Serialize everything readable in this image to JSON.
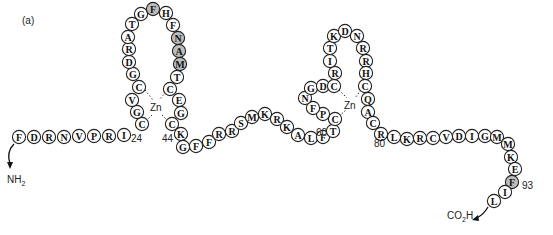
{
  "panel_label": "(a)",
  "colors": {
    "residue_fill": "#ffffff",
    "residue_highlight": "#bdbdbd",
    "stroke": "#222222"
  },
  "termini": {
    "n_term": "NH2",
    "c_term": "CO2H"
  },
  "zinc_labels": [
    "Zn",
    "Zn"
  ],
  "position_labels": [
    {
      "text": "24",
      "x": 131,
      "y": 142
    },
    {
      "text": "44",
      "x": 162,
      "y": 142
    },
    {
      "text": "60",
      "x": 316,
      "y": 136
    },
    {
      "text": "80",
      "x": 374,
      "y": 147
    },
    {
      "text": "93",
      "x": 522,
      "y": 189
    }
  ],
  "residues": [
    {
      "aa": "F",
      "x": 19,
      "y": 137
    },
    {
      "aa": "D",
      "x": 34,
      "y": 137
    },
    {
      "aa": "R",
      "x": 49,
      "y": 137
    },
    {
      "aa": "N",
      "x": 64,
      "y": 137
    },
    {
      "aa": "V",
      "x": 79,
      "y": 136
    },
    {
      "aa": "P",
      "x": 94,
      "y": 136
    },
    {
      "aa": "R",
      "x": 109,
      "y": 136
    },
    {
      "aa": "I",
      "x": 124,
      "y": 135
    },
    {
      "aa": "C",
      "x": 142,
      "y": 124
    },
    {
      "aa": "G",
      "x": 137,
      "y": 112
    },
    {
      "aa": "V",
      "x": 132,
      "y": 100
    },
    {
      "aa": "C",
      "x": 139,
      "y": 87
    },
    {
      "aa": "G",
      "x": 133,
      "y": 74
    },
    {
      "aa": "D",
      "x": 129,
      "y": 62
    },
    {
      "aa": "R",
      "x": 129,
      "y": 49
    },
    {
      "aa": "A",
      "x": 128,
      "y": 37
    },
    {
      "aa": "T",
      "x": 132,
      "y": 24
    },
    {
      "aa": "G",
      "x": 141,
      "y": 14
    },
    {
      "aa": "F",
      "x": 153,
      "y": 9,
      "hl": true
    },
    {
      "aa": "H",
      "x": 166,
      "y": 13
    },
    {
      "aa": "F",
      "x": 173,
      "y": 25
    },
    {
      "aa": "N",
      "x": 178,
      "y": 38,
      "hl": true
    },
    {
      "aa": "A",
      "x": 179,
      "y": 51,
      "hl": true
    },
    {
      "aa": "M",
      "x": 180,
      "y": 64,
      "hl": true
    },
    {
      "aa": "T",
      "x": 177,
      "y": 77
    },
    {
      "aa": "C",
      "x": 170,
      "y": 89
    },
    {
      "aa": "E",
      "x": 179,
      "y": 100
    },
    {
      "aa": "G",
      "x": 181,
      "y": 113
    },
    {
      "aa": "C",
      "x": 172,
      "y": 124
    },
    {
      "aa": "K",
      "x": 181,
      "y": 134
    },
    {
      "aa": "G",
      "x": 183,
      "y": 147
    },
    {
      "aa": "F",
      "x": 196,
      "y": 146
    },
    {
      "aa": "F",
      "x": 209,
      "y": 142
    },
    {
      "aa": "R",
      "x": 219,
      "y": 134
    },
    {
      "aa": "R",
      "x": 232,
      "y": 131
    },
    {
      "aa": "S",
      "x": 241,
      "y": 123
    },
    {
      "aa": "M",
      "x": 252,
      "y": 117
    },
    {
      "aa": "K",
      "x": 265,
      "y": 114
    },
    {
      "aa": "R",
      "x": 277,
      "y": 119
    },
    {
      "aa": "K",
      "x": 287,
      "y": 127
    },
    {
      "aa": "A",
      "x": 298,
      "y": 135
    },
    {
      "aa": "L",
      "x": 311,
      "y": 138
    },
    {
      "aa": "F",
      "x": 323,
      "y": 137
    },
    {
      "aa": "T",
      "x": 333,
      "y": 131
    },
    {
      "aa": "C",
      "x": 335,
      "y": 119
    },
    {
      "aa": "P",
      "x": 323,
      "y": 114
    },
    {
      "aa": "F",
      "x": 313,
      "y": 108
    },
    {
      "aa": "N",
      "x": 305,
      "y": 98
    },
    {
      "aa": "G",
      "x": 311,
      "y": 88
    },
    {
      "aa": "D",
      "x": 323,
      "y": 86
    },
    {
      "aa": "C",
      "x": 334,
      "y": 86
    },
    {
      "aa": "R",
      "x": 335,
      "y": 73
    },
    {
      "aa": "I",
      "x": 330,
      "y": 61
    },
    {
      "aa": "T",
      "x": 330,
      "y": 48
    },
    {
      "aa": "K",
      "x": 334,
      "y": 36
    },
    {
      "aa": "D",
      "x": 345,
      "y": 31
    },
    {
      "aa": "N",
      "x": 357,
      "y": 36
    },
    {
      "aa": "R",
      "x": 363,
      "y": 48
    },
    {
      "aa": "R",
      "x": 366,
      "y": 61
    },
    {
      "aa": "H",
      "x": 366,
      "y": 73
    },
    {
      "aa": "C",
      "x": 365,
      "y": 86
    },
    {
      "aa": "Q",
      "x": 368,
      "y": 99
    },
    {
      "aa": "A",
      "x": 368,
      "y": 112
    },
    {
      "aa": "C",
      "x": 373,
      "y": 123
    },
    {
      "aa": "R",
      "x": 381,
      "y": 134
    },
    {
      "aa": "L",
      "x": 394,
      "y": 137
    },
    {
      "aa": "K",
      "x": 407,
      "y": 139
    },
    {
      "aa": "R",
      "x": 420,
      "y": 138
    },
    {
      "aa": "C",
      "x": 433,
      "y": 138
    },
    {
      "aa": "V",
      "x": 446,
      "y": 137
    },
    {
      "aa": "D",
      "x": 459,
      "y": 136
    },
    {
      "aa": "I",
      "x": 472,
      "y": 136
    },
    {
      "aa": "G",
      "x": 485,
      "y": 136
    },
    {
      "aa": "M",
      "x": 497,
      "y": 137
    },
    {
      "aa": "M",
      "x": 508,
      "y": 144
    },
    {
      "aa": "K",
      "x": 511,
      "y": 157
    },
    {
      "aa": "E",
      "x": 515,
      "y": 169
    },
    {
      "aa": "F",
      "x": 512,
      "y": 182,
      "hl": true
    },
    {
      "aa": "I",
      "x": 505,
      "y": 192
    },
    {
      "aa": "L",
      "x": 494,
      "y": 201
    }
  ]
}
